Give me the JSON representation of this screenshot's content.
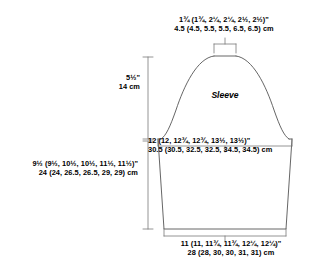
{
  "diagram": {
    "title": "Sleeve",
    "type": "knitting-pattern-schematic",
    "line_color": "#555555",
    "text_color": "#000000",
    "background": "#ffffff",
    "shape": {
      "cap": "bell-curve-with-flat-top",
      "body": "trapezoid-tapering-to-cuff"
    }
  },
  "measurements": {
    "top_width": {
      "name": "sleeve-cap-top-width",
      "imperial": "1¾ (1¾, 2¼, 2¼, 2½, 2½)\"",
      "metric": "4.5 (4.5, 5.5, 5.5, 6.5, 6.5) cm",
      "imperial_values": [
        "1¾",
        "1¾",
        "2¼",
        "2¼",
        "2½",
        "2½"
      ],
      "metric_values": [
        4.5,
        4.5,
        5.5,
        5.5,
        6.5,
        6.5
      ],
      "unit_imperial": "in",
      "unit_metric": "cm"
    },
    "cap_height": {
      "name": "sleeve-cap-height",
      "imperial": "5½\"",
      "metric": "14 cm",
      "imperial_values": [
        "5½"
      ],
      "metric_values": [
        14
      ],
      "unit_imperial": "in",
      "unit_metric": "cm"
    },
    "upper_arm_width": {
      "name": "upper-arm-width",
      "imperial": "12 (12, 12¾, 12¾, 13½, 13½)\"",
      "metric": "30.5 (30.5, 32.5, 32.5, 34.5, 34.5) cm",
      "imperial_values": [
        "12",
        "12",
        "12¾",
        "12¾",
        "13½",
        "13½"
      ],
      "metric_values": [
        30.5,
        30.5,
        32.5,
        32.5,
        34.5,
        34.5
      ],
      "unit_imperial": "in",
      "unit_metric": "cm"
    },
    "body_length": {
      "name": "sleeve-length-to-underarm",
      "imperial": "9½ (9½, 10½, 10½, 11½, 11½)\"",
      "metric": "24 (24, 26.5, 26.5, 29, 29) cm",
      "imperial_values": [
        "9½",
        "9½",
        "10½",
        "10½",
        "11½",
        "11½"
      ],
      "metric_values": [
        24,
        24,
        26.5,
        26.5,
        29,
        29
      ],
      "unit_imperial": "in",
      "unit_metric": "cm"
    },
    "bottom_width": {
      "name": "cuff-width",
      "imperial": "11 (11, 11¾, 11¾, 12¼, 12¼)\"",
      "metric": "28 (28, 30, 30, 31, 31) cm",
      "imperial_values": [
        "11",
        "11",
        "11¾",
        "11¾",
        "12¼",
        "12¼"
      ],
      "metric_values": [
        28,
        28,
        30,
        30,
        31,
        31
      ],
      "unit_imperial": "in",
      "unit_metric": "cm"
    }
  }
}
